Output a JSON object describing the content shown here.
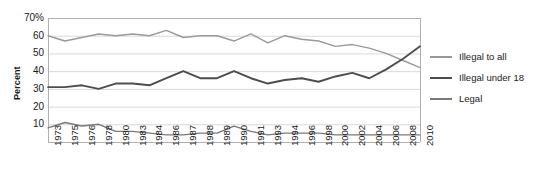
{
  "chart_data": {
    "type": "line",
    "title": "",
    "subtitle": "",
    "xlabel": "",
    "ylabel": "Percent",
    "ylim": [
      0,
      70
    ],
    "yticks": [
      70,
      60,
      50,
      40,
      30,
      20,
      10
    ],
    "ytick_labels": [
      "70%",
      "60",
      "50",
      "40",
      "30",
      "20",
      "10"
    ],
    "grid": "horizontal",
    "legend_position": "right",
    "categories": [
      "1973",
      "1975",
      "1976",
      "1978",
      "1980",
      "1983",
      "1984",
      "1986",
      "1987",
      "1988",
      "1989",
      "1990",
      "1991",
      "1993",
      "1994",
      "1996",
      "1998",
      "2000",
      "2002",
      "2004",
      "2006",
      "2008",
      "2010"
    ],
    "series": [
      {
        "name": "Illegal to all",
        "color": "#9a9a9a",
        "values": [
          60,
          57,
          59,
          61,
          60,
          61,
          60,
          63,
          59,
          60,
          60,
          57,
          61,
          56,
          60,
          58,
          57,
          54,
          55,
          53,
          50,
          46,
          42
        ]
      },
      {
        "name": "Illegal under 18",
        "color": "#4d4d4d",
        "values": [
          31,
          31,
          32,
          30,
          33,
          33,
          32,
          36,
          40,
          36,
          36,
          40,
          36,
          33,
          35,
          36,
          34,
          37,
          39,
          36,
          41,
          47,
          54
        ]
      },
      {
        "name": "Legal",
        "color": "#7a7a7a",
        "values": [
          8,
          11,
          9,
          10,
          6,
          6,
          5,
          4,
          4,
          5,
          5,
          9,
          6,
          4,
          5,
          5,
          5,
          4,
          4,
          4,
          4,
          4,
          4
        ]
      }
    ]
  },
  "legend": {
    "items": [
      {
        "label": "Illegal to all",
        "color": "#9a9a9a"
      },
      {
        "label": "Illegal under 18",
        "color": "#4d4d4d"
      },
      {
        "label": "Legal",
        "color": "#7a7a7a"
      }
    ]
  },
  "axes": {
    "y_label": "Percent"
  },
  "colors": {
    "grid": "#d9d9d9",
    "axis": "#b0b0b0",
    "text": "#1a1a1a",
    "background": "#ffffff"
  }
}
